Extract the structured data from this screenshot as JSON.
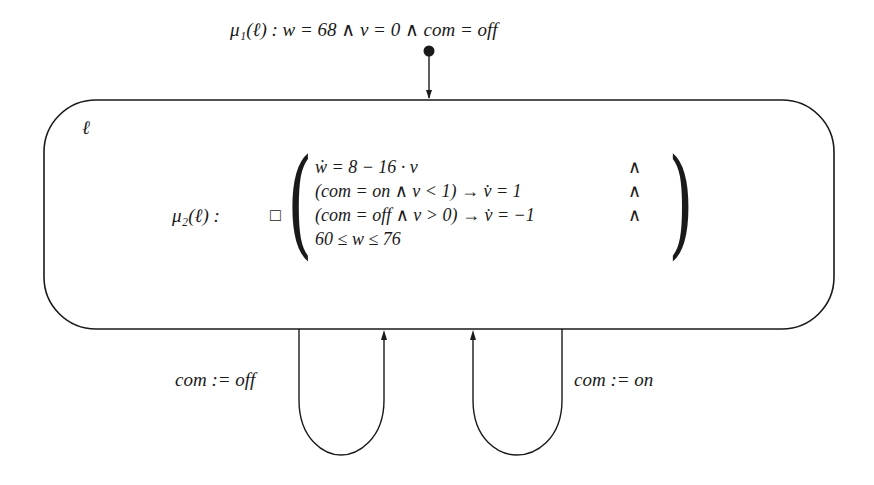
{
  "diagram": {
    "type": "hybrid-automaton",
    "initial_condition": {
      "label": "μ₁(ℓ) :  w = 68 ∧ v = 0 ∧ com = off"
    },
    "location": {
      "name": "ℓ",
      "invariant_label": "μ₂(ℓ) :",
      "always_operator": "□",
      "invariant_lines": [
        {
          "lhs": "ẇ = 8 − 16 · v",
          "conj": "∧"
        },
        {
          "lhs": "(com = on ∧ v < 1)  →  v̇ =  1",
          "conj": "∧"
        },
        {
          "lhs": "(com = off ∧ v > 0)  →  v̇ = −1",
          "conj": "∧"
        },
        {
          "lhs": "60 ≤ w ≤ 76",
          "conj": ""
        }
      ]
    },
    "edges": [
      {
        "label": "com := off",
        "from": "ℓ",
        "to": "ℓ"
      },
      {
        "label": "com := on",
        "from": "ℓ",
        "to": "ℓ"
      }
    ],
    "colors": {
      "stroke": "#1a1a1a",
      "background": "#ffffff"
    }
  }
}
